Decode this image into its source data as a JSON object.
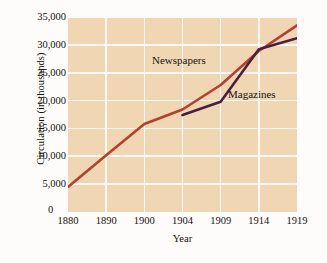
{
  "chart_data": {
    "type": "line",
    "title": "",
    "xlabel": "Year",
    "ylabel": "Circulation (in thousands)",
    "x_tick_labels": [
      "1880",
      "1890",
      "1900",
      "1904",
      "1909",
      "1914",
      "1919"
    ],
    "x_tick_values": [
      1880,
      1890,
      1900,
      1904,
      1909,
      1914,
      1919
    ],
    "y_tick_labels": [
      "0",
      "5,000",
      "10,000",
      "15,000",
      "20,000",
      "25,000",
      "30,000",
      "35,000"
    ],
    "y_tick_values": [
      0,
      5000,
      10000,
      15000,
      20000,
      25000,
      30000,
      35000
    ],
    "ylim": [
      0,
      35000
    ],
    "grid": true,
    "legend_position": "inline-annotations",
    "plot_background": "#f1d6b4",
    "gridline_color": "#fdfaf5",
    "series": [
      {
        "name": "Newspapers",
        "color": "#b5402e",
        "x": [
          1880,
          1890,
          1900,
          1904,
          1909,
          1914,
          1919
        ],
        "values": [
          4500,
          10200,
          15800,
          18400,
          22800,
          28900,
          33500
        ]
      },
      {
        "name": "Magazines",
        "color": "#49203f",
        "x": [
          1904,
          1909,
          1914,
          1919
        ],
        "values": [
          17400,
          19800,
          29200,
          31200
        ]
      }
    ]
  },
  "annotations": {
    "newspapers_label": "Newspapers",
    "magazines_label": "Magazines"
  }
}
